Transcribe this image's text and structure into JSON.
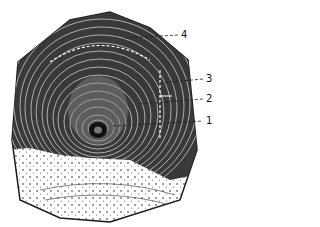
{
  "figure": {
    "colors": {
      "ink": "#1a1a1a",
      "paper": "#ffffff",
      "shade": "#3a3a3a"
    },
    "callouts": [
      {
        "label": "4",
        "x": 181,
        "y": 30
      },
      {
        "label": "3",
        "x": 206,
        "y": 74
      },
      {
        "label": "2",
        "x": 206,
        "y": 94
      },
      {
        "label": "1",
        "x": 206,
        "y": 116
      }
    ]
  }
}
